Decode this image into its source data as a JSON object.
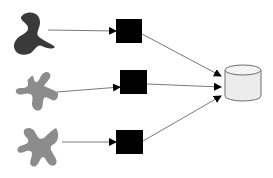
{
  "diagram": {
    "colors": {
      "background": "#ffffff",
      "dark_shape": "#3a3a3a",
      "gray_shape": "#8c8c8c",
      "box": "#000000",
      "arrow": "#7a7a7a",
      "arrowhead": "#000000",
      "cylinder_fill": "#ececec",
      "cylinder_stroke": "#6e6e6e"
    },
    "sources": [
      {
        "id": "source-1",
        "shape": "dark-blob"
      },
      {
        "id": "source-2",
        "shape": "gray-splat"
      },
      {
        "id": "source-3",
        "shape": "gray-splat"
      }
    ],
    "processors": [
      {
        "id": "box-1"
      },
      {
        "id": "box-2"
      },
      {
        "id": "box-3"
      }
    ],
    "sink": {
      "id": "database",
      "shape": "cylinder"
    },
    "edges": [
      {
        "from": "source-1",
        "to": "box-1"
      },
      {
        "from": "source-2",
        "to": "box-2"
      },
      {
        "from": "source-3",
        "to": "box-3"
      },
      {
        "from": "box-1",
        "to": "database"
      },
      {
        "from": "box-2",
        "to": "database"
      },
      {
        "from": "box-3",
        "to": "database"
      }
    ]
  }
}
